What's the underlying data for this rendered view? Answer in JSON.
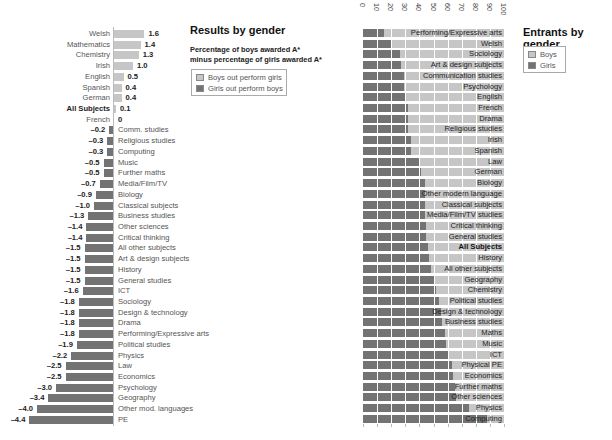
{
  "left_panel": {
    "title": "Results by gender",
    "subtitle_line1": "Percentage of boys awarded A*",
    "subtitle_line2": "minus percentage of girls awarded A*",
    "legend": [
      {
        "label": "Boys out perform girls",
        "color": "#c6c6c6"
      },
      {
        "label": "Girls out perform boys",
        "color": "#737373"
      }
    ]
  },
  "right_panel": {
    "title": "Entrants by gender",
    "legend": [
      {
        "label": "Boys",
        "color": "#c6c6c6"
      },
      {
        "label": "Girls",
        "color": "#737373"
      }
    ],
    "ticks": [
      "0",
      "10",
      "20",
      "30",
      "40",
      "50",
      "60",
      "70",
      "80",
      "90",
      "100"
    ]
  },
  "colors": {
    "light": "#c6c6c6",
    "dark": "#737373"
  },
  "chart_data": [
    {
      "type": "bar",
      "orientation": "horizontal",
      "title": "Results by gender",
      "subtitle": "Percentage of boys awarded A* minus percentage of girls awarded A*",
      "legend": [
        "Boys out perform girls",
        "Girls out perform boys"
      ],
      "categories": [
        "Welsh",
        "Mathematics",
        "Chemistry",
        "Irish",
        "English",
        "Spanish",
        "German",
        "All Subjects",
        "French",
        "Comm. studies",
        "Religious studies",
        "Computing",
        "Music",
        "Further maths",
        "Media/Film/TV",
        "Biology",
        "Classical subjects",
        "Business studies",
        "Other sciences",
        "Critical thinking",
        "All other subjects",
        "Art & design subjects",
        "History",
        "General studies",
        "ICT",
        "Sociology",
        "Design & technology",
        "Drama",
        "Performing/Expressive arts",
        "Political studies",
        "Physics",
        "Law",
        "Economics",
        "Psychology",
        "Geography",
        "Other mod. languages",
        "PE"
      ],
      "values": [
        1.6,
        1.4,
        1.3,
        1.0,
        0.5,
        0.4,
        0.4,
        0.1,
        0,
        -0.2,
        -0.3,
        -0.3,
        -0.5,
        -0.5,
        -0.7,
        -0.9,
        -1.0,
        -1.3,
        -1.4,
        -1.4,
        -1.5,
        -1.5,
        -1.5,
        -1.5,
        -1.6,
        -1.8,
        -1.8,
        -1.8,
        -1.8,
        -1.9,
        -2.2,
        -2.5,
        -2.5,
        -3.0,
        -3.4,
        -4.0,
        -4.4
      ],
      "value_labels": [
        "1.6",
        "1.4",
        "1.3",
        "1.0",
        "0.5",
        "0.4",
        "0.4",
        "0.1",
        "0",
        "–0.2",
        "–0.3",
        "–0.3",
        "–0.5",
        "–0.5",
        "–0.7",
        "–0.9",
        "–1.0",
        "–1.3",
        "–1.4",
        "–1.4",
        "–1.5",
        "–1.5",
        "–1.5",
        "–1.5",
        "–1.6",
        "–1.8",
        "–1.8",
        "–1.8",
        "–1.8",
        "–1.9",
        "–2.2",
        "–2.5",
        "–2.5",
        "–3.0",
        "–3.4",
        "–4.0",
        "–4.4"
      ],
      "bold_categories": [
        "All Subjects"
      ],
      "xlabel": "",
      "ylabel": "",
      "xlim": [
        -4.4,
        1.6
      ],
      "grid": false
    },
    {
      "type": "bar",
      "orientation": "horizontal",
      "stacked": true,
      "title": "Entrants by gender",
      "legend": [
        "Boys",
        "Girls"
      ],
      "x_ticks": [
        0,
        10,
        20,
        30,
        40,
        50,
        60,
        70,
        80,
        90,
        100
      ],
      "xlim": [
        0,
        100
      ],
      "grid": true,
      "categories": [
        "Performing/Expressive arts",
        "Welsh",
        "Sociology",
        "Art & design subjects",
        "Communication studies",
        "Psychology",
        "English",
        "French",
        "Drama",
        "Religious studies",
        "Irish",
        "Spanish",
        "Law",
        "German",
        "Biology",
        "Other modern language",
        "Classical subjects",
        "Media/Film/TV studies",
        "Critical thinking",
        "General studies",
        "All Subjects",
        "History",
        "All other subjects",
        "Geography",
        "Chemistry",
        "Political studies",
        "Design & technology",
        "Business studies",
        "Maths",
        "Music",
        "ICT",
        "Physical PE",
        "Economics",
        "Further maths",
        "Other sciences",
        "Physics",
        "Computing"
      ],
      "bold_categories": [
        "All Subjects"
      ],
      "series": [
        {
          "name": "Girls",
          "color": "#737373",
          "values": [
            15,
            20,
            26,
            27,
            29,
            29,
            30,
            32,
            32,
            32,
            34,
            34,
            40,
            41,
            44,
            44,
            44,
            44,
            45,
            45,
            46,
            47,
            48,
            51,
            52,
            54,
            55,
            56,
            58,
            59,
            60,
            63,
            64,
            65,
            66,
            75,
            88
          ]
        },
        {
          "name": "Boys",
          "color": "#c6c6c6",
          "values": [
            85,
            80,
            74,
            73,
            71,
            71,
            70,
            68,
            68,
            68,
            66,
            66,
            60,
            59,
            56,
            56,
            56,
            56,
            55,
            55,
            54,
            53,
            52,
            49,
            48,
            46,
            45,
            44,
            42,
            41,
            40,
            37,
            36,
            35,
            34,
            25,
            12
          ]
        }
      ]
    }
  ]
}
